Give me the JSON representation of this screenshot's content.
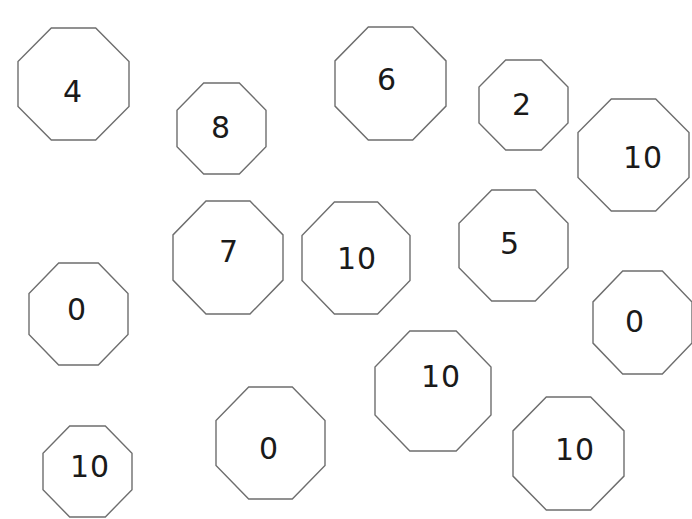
{
  "octagons": [
    {
      "label": "4",
      "x": 18,
      "y": 28,
      "w": 111,
      "h": 112,
      "tx": 73,
      "ty": 92
    },
    {
      "label": "8",
      "x": 177,
      "y": 83,
      "w": 89,
      "h": 91,
      "tx": 221,
      "ty": 128
    },
    {
      "label": "6",
      "x": 335,
      "y": 27,
      "w": 111,
      "h": 113,
      "tx": 387,
      "ty": 80
    },
    {
      "label": "2",
      "x": 479,
      "y": 60,
      "w": 89,
      "h": 90,
      "tx": 522,
      "ty": 105
    },
    {
      "label": "10",
      "x": 578,
      "y": 99,
      "w": 111,
      "h": 112,
      "tx": 643,
      "ty": 158
    },
    {
      "label": "7",
      "x": 173,
      "y": 201,
      "w": 110,
      "h": 113,
      "tx": 229,
      "ty": 252
    },
    {
      "label": "10",
      "x": 302,
      "y": 202,
      "w": 108,
      "h": 112,
      "tx": 357,
      "ty": 259
    },
    {
      "label": "5",
      "x": 459,
      "y": 190,
      "w": 109,
      "h": 111,
      "tx": 510,
      "ty": 244
    },
    {
      "label": "0",
      "x": 29,
      "y": 263,
      "w": 99,
      "h": 102,
      "tx": 77,
      "ty": 310
    },
    {
      "label": "0",
      "x": 593,
      "y": 271,
      "w": 99,
      "h": 103,
      "tx": 635,
      "ty": 322
    },
    {
      "label": "10",
      "x": 375,
      "y": 331,
      "w": 116,
      "h": 120,
      "tx": 441,
      "ty": 377
    },
    {
      "label": "0",
      "x": 216,
      "y": 387,
      "w": 109,
      "h": 112,
      "tx": 269,
      "ty": 449
    },
    {
      "label": "10",
      "x": 513,
      "y": 397,
      "w": 111,
      "h": 113,
      "tx": 575,
      "ty": 450
    },
    {
      "label": "10",
      "x": 43,
      "y": 426,
      "w": 89,
      "h": 91,
      "tx": 90,
      "ty": 467
    }
  ]
}
